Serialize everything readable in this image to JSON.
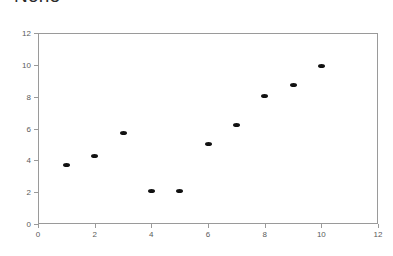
{
  "chart_data": {
    "type": "scatter",
    "title": "None",
    "xlabel": "",
    "ylabel": "",
    "xlim": [
      0,
      12
    ],
    "ylim": [
      0,
      12
    ],
    "xticks": [
      0,
      2,
      4,
      6,
      8,
      10,
      12
    ],
    "yticks": [
      0,
      2,
      4,
      6,
      8,
      10,
      12
    ],
    "xtick_labels": [
      "0",
      "2",
      "4",
      "6",
      "8",
      "10",
      "12"
    ],
    "ytick_labels": [
      "0",
      "2",
      "4",
      "6",
      "8",
      "10",
      "12"
    ],
    "grid": false,
    "legend": false,
    "marker_color": "#111111",
    "frame_color": "#9a9a9a",
    "background": "#ffffff",
    "series": [
      {
        "name": "points",
        "marker": "diamond",
        "points": [
          {
            "x": 1,
            "y": 3.7
          },
          {
            "x": 2,
            "y": 4.3
          },
          {
            "x": 3,
            "y": 5.7
          },
          {
            "x": 4,
            "y": 2.1
          },
          {
            "x": 5,
            "y": 2.1
          },
          {
            "x": 6,
            "y": 5.05
          },
          {
            "x": 7,
            "y": 6.2
          },
          {
            "x": 8,
            "y": 8.05
          },
          {
            "x": 9,
            "y": 8.75
          },
          {
            "x": 10,
            "y": 9.9
          }
        ]
      }
    ]
  }
}
